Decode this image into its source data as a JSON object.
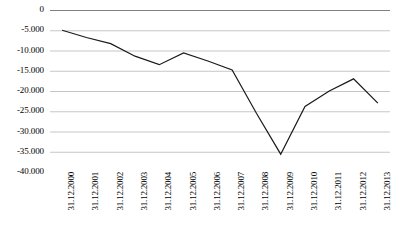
{
  "chart_data": {
    "type": "line",
    "title": "",
    "subtitle": "",
    "xlabel": "",
    "ylabel": "",
    "grid": true,
    "legend": false,
    "legend_position": "none",
    "axis_position": "top",
    "line_color": "#1a1a1a",
    "grid_color": "#c0c0c0",
    "axis_color": "#808080",
    "categories": [
      "31.12.2000",
      "31.12.2001",
      "31.12.2002",
      "31.12.2003",
      "31.12.2004",
      "31.12.2005",
      "31.12.2006",
      "31.12.2007",
      "31.12.2008",
      "31.12.2009",
      "31.12.2010",
      "31.12.2011",
      "31.12.2012",
      "31.12.2013"
    ],
    "values": [
      -5000,
      -6800,
      -8300,
      -11400,
      -13500,
      -10600,
      -12600,
      -14800,
      -25500,
      -35600,
      -23800,
      -20000,
      -17000,
      -23000
    ],
    "ylim": [
      -40000,
      0
    ],
    "ytick_values": [
      0,
      -5000,
      -10000,
      -15000,
      -20000,
      -25000,
      -30000,
      -35000,
      -40000
    ],
    "ytick_labels": [
      "0",
      "-5.000",
      "-10.000",
      "-15.000",
      "-20.000",
      "-25.000",
      "-30.000",
      "-35.000",
      "-40.000"
    ]
  }
}
